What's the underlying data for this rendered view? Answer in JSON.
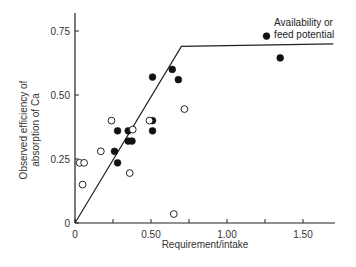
{
  "chart_data": {
    "type": "scatter",
    "title": "",
    "xlabel": "Requirement/intake",
    "ylabel_lines": [
      "Observed efficiency of",
      "absorption of Ca"
    ],
    "xlim": [
      0,
      1.72
    ],
    "ylim": [
      0,
      0.82
    ],
    "x_ticks": [
      0,
      0.25,
      0.5,
      0.75,
      1.0,
      1.25,
      1.5
    ],
    "x_tick_labels": [
      {
        "value": 0,
        "label": "0"
      },
      {
        "value": 0.5,
        "label": "0.50"
      },
      {
        "value": 1.0,
        "label": "1.00"
      },
      {
        "value": 1.5,
        "label": "1.50"
      }
    ],
    "y_ticks": [
      0,
      0.25,
      0.5,
      0.75
    ],
    "y_tick_labels": [
      {
        "value": 0,
        "label": "0"
      },
      {
        "value": 0.25,
        "label": "0.25"
      },
      {
        "value": 0.5,
        "label": "0.50"
      },
      {
        "value": 0.75,
        "label": "0.75"
      }
    ],
    "grid": false,
    "legend": null,
    "annotations": [
      {
        "lines": [
          "Availability or",
          "feed potential"
        ],
        "x": 1.31,
        "y": 0.76
      }
    ],
    "line": {
      "name": "Availability or feed potential",
      "points": [
        [
          0,
          0
        ],
        [
          0.7,
          0.69
        ],
        [
          1.7,
          0.7
        ]
      ]
    },
    "series": [
      {
        "name": "filled",
        "marker": "filled-circle",
        "points": [
          [
            0.26,
            0.28
          ],
          [
            0.28,
            0.235
          ],
          [
            0.28,
            0.36
          ],
          [
            0.35,
            0.36
          ],
          [
            0.35,
            0.32
          ],
          [
            0.375,
            0.32
          ],
          [
            0.51,
            0.4
          ],
          [
            0.51,
            0.36
          ],
          [
            0.51,
            0.57
          ],
          [
            0.64,
            0.6
          ],
          [
            0.68,
            0.56
          ],
          [
            1.26,
            0.73
          ],
          [
            1.35,
            0.645
          ]
        ]
      },
      {
        "name": "open",
        "marker": "open-circle",
        "points": [
          [
            0.03,
            0.235
          ],
          [
            0.06,
            0.235
          ],
          [
            0.05,
            0.15
          ],
          [
            0.17,
            0.28
          ],
          [
            0.24,
            0.4
          ],
          [
            0.38,
            0.365
          ],
          [
            0.36,
            0.195
          ],
          [
            0.49,
            0.4
          ],
          [
            0.72,
            0.445
          ],
          [
            0.65,
            0.035
          ]
        ]
      }
    ]
  }
}
